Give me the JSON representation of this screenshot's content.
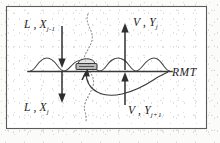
{
  "figure": {
    "border_color": "#5c5c5c",
    "ink_color": "#2f2f2f",
    "background": "#fbfbfa"
  },
  "labels": {
    "liquid_in": {
      "main": "L , X",
      "sub": "j-1",
      "position": "top-left"
    },
    "liquid_out": {
      "main": "L , X",
      "sub": "j",
      "position": "bottom-left"
    },
    "vapor_out": {
      "main": "V , Y",
      "sub": "j",
      "position": "top-right"
    },
    "vapor_in": {
      "main": "V , Y",
      "sub": "j+1",
      "position": "bottom-right"
    },
    "tray": {
      "text": "RMT",
      "position": "right-middle"
    }
  },
  "elements": {
    "tray_line": "horizontal tray deck",
    "froth_layer": "wavy froth / liquid on tray",
    "bubble_cap": "shaded bubble cap riser at tray center",
    "dotted_path": "dotted serpentine vapor path through tray",
    "leader_line": "curved leader from bubble cap to RMT label"
  },
  "arrows": {
    "liquid_in_arrow": {
      "direction": "down",
      "side": "left"
    },
    "liquid_out_arrow": {
      "direction": "down",
      "side": "left"
    },
    "vapor_out_arrow": {
      "direction": "up",
      "side": "right"
    },
    "vapor_in_arrow": {
      "direction": "up",
      "side": "right"
    }
  }
}
